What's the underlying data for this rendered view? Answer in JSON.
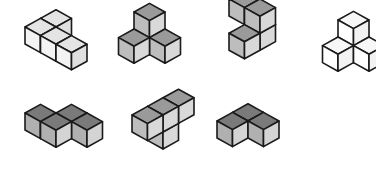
{
  "cube": {
    "dx": 15.5,
    "dy": 8.6,
    "h": 17
  },
  "shades": {
    "light": {
      "top": "#e4e4e4",
      "left": "#f3f3f3",
      "right": "#e0e0e0"
    },
    "medium": {
      "top": "#9a9a9a",
      "left": "#bdbdbd",
      "right": "#d9d9d9"
    },
    "dark": {
      "top": "#7a7a7a",
      "left": "#b0b0b0",
      "right": "#d4d4d4"
    },
    "white": {
      "top": "#f7f7f7",
      "left": "#ffffff",
      "right": "#f2f2f2"
    }
  },
  "figures": [
    {
      "name": "figure-1",
      "shade": "light",
      "origin": [
        25,
        44
      ],
      "cubes": [
        [
          0,
          1,
          0
        ],
        [
          0,
          0,
          0
        ],
        [
          1,
          0,
          0
        ],
        [
          2,
          0,
          0
        ]
      ]
    },
    {
      "name": "figure-2",
      "shade": "medium",
      "origin": [
        134,
        46
      ],
      "cubes": [
        [
          0,
          0,
          0
        ],
        [
          0,
          0,
          1
        ],
        [
          1,
          0,
          0
        ],
        [
          0,
          -1,
          0
        ]
      ]
    },
    {
      "name": "figure-3",
      "shade": "medium",
      "origin": [
        229,
        33
      ],
      "cubes": [
        [
          1,
          -1,
          0
        ],
        [
          1,
          0,
          0
        ],
        [
          0,
          0,
          1
        ],
        [
          1,
          0,
          1
        ]
      ]
    },
    {
      "name": "figure-4",
      "shade": "white",
      "origin": [
        338,
        54
      ],
      "cubes": [
        [
          0,
          0,
          0
        ],
        [
          0,
          0,
          1
        ],
        [
          0,
          -1,
          0
        ],
        [
          1,
          0,
          0
        ]
      ]
    },
    {
      "name": "figure-5",
      "shade": "dark",
      "origin": [
        25,
        130
      ],
      "cubes": [
        [
          1,
          1,
          0
        ],
        [
          0,
          0,
          0
        ],
        [
          2,
          1,
          0
        ],
        [
          1,
          0,
          0
        ]
      ]
    },
    {
      "name": "figure-6",
      "shade": "medium",
      "origin": [
        132,
        149
      ],
      "cubes": [
        [
          0,
          1,
          0
        ],
        [
          0,
          0,
          1
        ],
        [
          0,
          1,
          1
        ],
        [
          0,
          2,
          1
        ]
      ]
    },
    {
      "name": "figure-7",
      "shade": "dark",
      "origin": [
        217,
        138
      ],
      "cubes": [
        [
          0,
          1,
          0
        ],
        [
          0,
          0,
          0
        ],
        [
          1,
          1,
          0
        ]
      ]
    }
  ]
}
